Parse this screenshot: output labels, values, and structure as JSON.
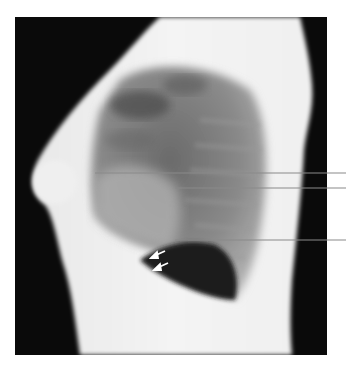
{
  "figure": {
    "type": "lateral chest radiograph",
    "background_color": "#ffffff",
    "frame": {
      "x": 15,
      "y": 17,
      "width": 312,
      "height": 338,
      "color": "#0a0a0a"
    },
    "leader_lines": [
      {
        "id": "line-1",
        "x1": 95,
        "y1": 173,
        "x2": 346,
        "y2": 173,
        "color": "#8a8a8a"
      },
      {
        "id": "line-2",
        "x1": 175,
        "y1": 188,
        "x2": 346,
        "y2": 188,
        "color": "#8a8a8a"
      },
      {
        "id": "line-3",
        "x1": 175,
        "y1": 240,
        "x2": 346,
        "y2": 240,
        "color": "#8a8a8a"
      }
    ],
    "arrows": [
      {
        "id": "arrow-1",
        "x1": 165,
        "y1": 251,
        "x2": 152,
        "y2": 257,
        "color": "#ffffff"
      },
      {
        "id": "arrow-2",
        "x1": 168,
        "y1": 263,
        "x2": 155,
        "y2": 269,
        "color": "#ffffff"
      }
    ]
  }
}
